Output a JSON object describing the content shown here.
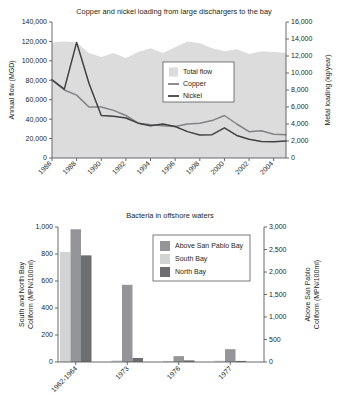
{
  "chart_data": [
    {
      "type": "area",
      "id": "copper-nickel-loading",
      "title": "Copper and nickel loading from large dischargers to the bay",
      "xlabel": "",
      "ylabel": "Annual flow (MGD)",
      "y2label": "Metal loading (kg/year)",
      "ylim": [
        0,
        140000
      ],
      "y2lim": [
        0,
        16000
      ],
      "ytick_labels": [
        "0",
        "20,000",
        "40,000",
        "60,000",
        "80,000",
        "100,000",
        "120,000",
        "140,000"
      ],
      "yticks": [
        0,
        20000,
        40000,
        60000,
        80000,
        100000,
        120000,
        140000
      ],
      "y2tick_labels": [
        "0",
        "2,000",
        "4,000",
        "6,000",
        "8,000",
        "10,000",
        "12,000",
        "14,000",
        "16,000"
      ],
      "y2ticks": [
        0,
        2000,
        4000,
        6000,
        8000,
        10000,
        12000,
        14000,
        16000
      ],
      "xtick_labels": [
        "1986",
        "1988",
        "1990",
        "1992",
        "1994",
        "1996",
        "1998",
        "2000",
        "2002",
        "2004"
      ],
      "xticks": [
        1986,
        1988,
        1990,
        1992,
        1994,
        1996,
        1998,
        2000,
        2002,
        2004
      ],
      "xlim": [
        1986,
        2005
      ],
      "grid": false,
      "legend_position": "center-right",
      "x": [
        1986,
        1987,
        1988,
        1989,
        1990,
        1991,
        1992,
        1993,
        1994,
        1995,
        1996,
        1997,
        1998,
        1999,
        2000,
        2001,
        2002,
        2003,
        2004,
        2005
      ],
      "series": [
        {
          "name": "Total flow",
          "kind": "area",
          "axis": "left",
          "color": "#dcdcdc",
          "values": [
            119000,
            120000,
            119000,
            108000,
            104000,
            108000,
            103000,
            109000,
            113000,
            108000,
            114000,
            120000,
            118000,
            113000,
            110000,
            112000,
            107000,
            110000,
            109000,
            108000
          ]
        },
        {
          "name": "Copper",
          "kind": "line",
          "axis": "right",
          "color": "#808285",
          "values": [
            9200,
            8000,
            7400,
            6000,
            6000,
            5600,
            5000,
            4100,
            3900,
            3800,
            3700,
            4000,
            4100,
            4400,
            5000,
            4000,
            3100,
            3200,
            2800,
            2750
          ]
        },
        {
          "name": "Nickel",
          "kind": "line",
          "axis": "right",
          "color": "#414042",
          "values": [
            9200,
            8100,
            13600,
            8800,
            5000,
            4900,
            4700,
            4100,
            3800,
            4000,
            3700,
            3100,
            2700,
            2750,
            3550,
            2650,
            2200,
            1950,
            1900,
            2000
          ]
        }
      ]
    },
    {
      "type": "bar",
      "id": "bacteria-offshore-waters",
      "title": "Bacteria in offshore waters",
      "xlabel": "",
      "ylabel": "South and North Bay Coliform (MPN/100ml)",
      "y2label": "Above San Pablo Coliform (MPN/100ml)",
      "ylim": [
        0,
        1000
      ],
      "y2lim": [
        0,
        3000
      ],
      "ytick_labels": [
        "0",
        "200",
        "400",
        "600",
        "800",
        "1,000"
      ],
      "yticks": [
        0,
        200,
        400,
        600,
        800,
        1000
      ],
      "y2tick_labels": [
        "0",
        "500",
        "1,000",
        "1,500",
        "2,000",
        "2,500",
        "3,000"
      ],
      "y2ticks": [
        0,
        500,
        1000,
        1500,
        2000,
        2500,
        3000
      ],
      "categories": [
        "1962-1964",
        "1973",
        "1976",
        "1977"
      ],
      "grid": false,
      "legend_position": "top-right",
      "series": [
        {
          "name": "South Bay",
          "axis": "left",
          "color": "#d1d3d4",
          "order": 1,
          "values": [
            815,
            12,
            8,
            10
          ]
        },
        {
          "name": "Above San Pablo Bay",
          "axis": "right",
          "color": "#939598",
          "order": 2,
          "values": [
            2950,
            1715,
            130,
            285
          ]
        },
        {
          "name": "North Bay",
          "axis": "left",
          "color": "#6d6e71",
          "order": 3,
          "values": [
            790,
            30,
            12,
            8
          ]
        }
      ],
      "legend_order": [
        "Above San Pablo Bay",
        "South Bay",
        "North Bay"
      ]
    }
  ]
}
